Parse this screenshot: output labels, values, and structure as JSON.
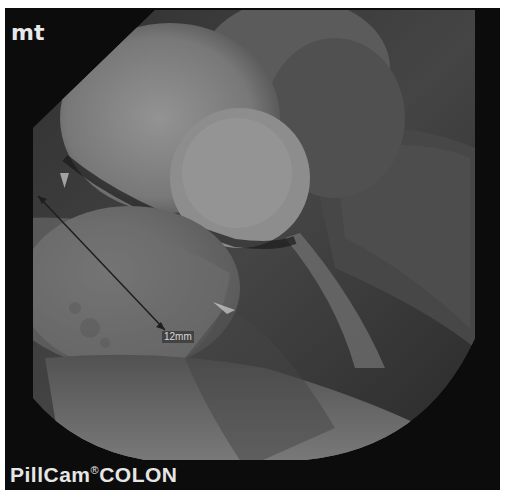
{
  "image": {
    "type": "capsule-endoscopy-frame",
    "overlay_top_left": "mt",
    "device_label": {
      "brand": "PillCam",
      "registered_mark": "®",
      "model": "COLON"
    },
    "measurement": {
      "label": "12mm",
      "start": [
        38,
        196
      ],
      "end": [
        165,
        330
      ]
    },
    "colors": {
      "frame": "#0c0c0c",
      "mucosa_light": "#cfcfcf",
      "mucosa_mid": "#8a8a8a",
      "mucosa_dark": "#3a3a3a",
      "text": "#e8e8e8"
    }
  }
}
